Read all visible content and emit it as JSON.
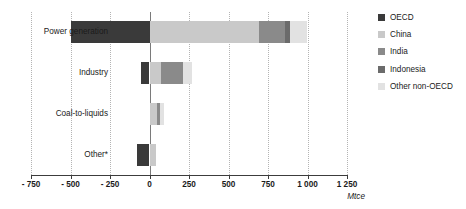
{
  "chart_data": {
    "type": "bar",
    "orientation": "horizontal",
    "stacked": true,
    "title": "",
    "xlabel": "Mtce",
    "ylabel": "",
    "xlim": [
      -750,
      1250
    ],
    "xticks": [
      -750,
      -500,
      -250,
      0,
      250,
      500,
      750,
      1000,
      1250
    ],
    "xticklabels": [
      "- 750",
      "- 500",
      "- 250",
      "0",
      "250",
      "500",
      "750",
      "1 000",
      "1 250"
    ],
    "grid": "vertical-dotted",
    "legend_position": "right",
    "categories": [
      "Power generation",
      "Industry",
      "Coal-to-liquids",
      "Other*"
    ],
    "series": [
      {
        "name": "OECD",
        "color": "#3a3a3a",
        "values": [
          -500,
          -55,
          0,
          -80
        ]
      },
      {
        "name": "China",
        "color": "#c9c9c9",
        "values": [
          690,
          75,
          50,
          40
        ]
      },
      {
        "name": "India",
        "color": "#8a8a8a",
        "values": [
          170,
          135,
          15,
          0
        ]
      },
      {
        "name": "Indonesia",
        "color": "#6b6b6b",
        "values": [
          30,
          0,
          0,
          0
        ]
      },
      {
        "name": "Other non-OECD",
        "color": "#e2e2e2",
        "values": [
          105,
          60,
          25,
          0
        ]
      }
    ]
  },
  "axis": {
    "unit_label": "Mtce"
  },
  "legend": {
    "items": [
      {
        "label": "OECD",
        "color": "#3a3a3a"
      },
      {
        "label": "China",
        "color": "#c9c9c9"
      },
      {
        "label": "India",
        "color": "#8a8a8a"
      },
      {
        "label": "Indonesia",
        "color": "#6b6b6b"
      },
      {
        "label": "Other non-OECD",
        "color": "#e2e2e2"
      }
    ]
  }
}
